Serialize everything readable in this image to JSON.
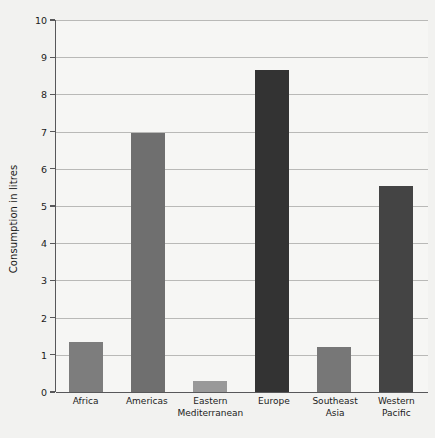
{
  "chart_data": {
    "type": "bar",
    "title": "",
    "xlabel": "",
    "ylabel": "Consumption in litres",
    "categories": [
      "Africa",
      "Americas",
      "Eastern\nMediterranean",
      "Europe",
      "Southeast\nAsia",
      "Western\nPacific"
    ],
    "values": [
      1.35,
      6.95,
      0.3,
      8.65,
      1.2,
      5.55
    ],
    "ylim": [
      0,
      10
    ],
    "yticks": [
      0,
      1,
      2,
      3,
      4,
      5,
      6,
      7,
      8,
      9,
      10
    ],
    "ytick_labels": [
      "0",
      "1",
      "2",
      "3",
      "4",
      "5",
      "6",
      "7",
      "8",
      "9",
      "10"
    ],
    "grid": true,
    "legend": null,
    "bar_colors": [
      "#7d7d7d",
      "#6f6f6f",
      "#999999",
      "#333333",
      "#777777",
      "#444444"
    ]
  },
  "colors": {
    "background": "#f2f2f0",
    "plot_background": "#f6f6f4",
    "axis": "#58585a",
    "gridline": "#b9b9b7",
    "text": "#1b1b1b"
  }
}
